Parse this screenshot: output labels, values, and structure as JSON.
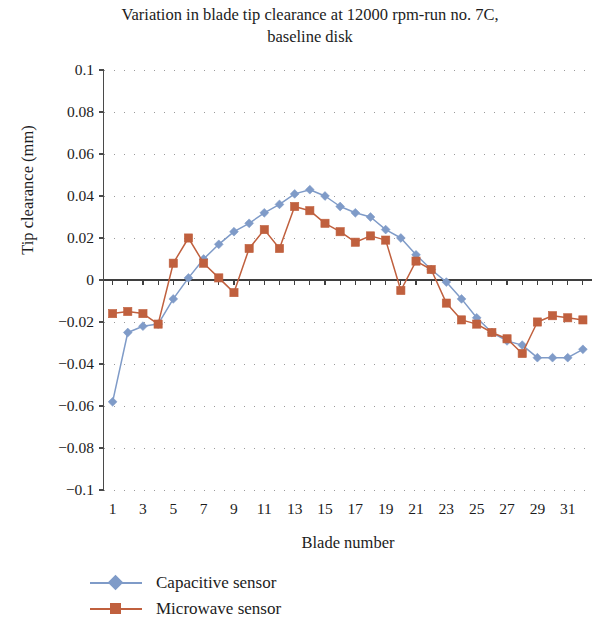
{
  "chart_data": {
    "type": "line",
    "title": "Variation in blade tip clearance at 12000 rpm-run no. 7C, baseline disk",
    "title_line1": "Variation in blade tip clearance at 12000 rpm-run no. 7C,",
    "title_line2": "baseline disk",
    "xlabel": "Blade number",
    "ylabel": "Tip clearance (mm)",
    "xlim": [
      0.4,
      32.6
    ],
    "ylim": [
      -0.1,
      0.1
    ],
    "grid": true,
    "grid_style": "dotted",
    "legend_position": "bottom-left",
    "y_ticks": [
      0.1,
      0.08,
      0.06,
      0.04,
      0.02,
      0,
      -0.02,
      -0.04,
      -0.06,
      -0.08,
      -0.1
    ],
    "y_tick_labels": [
      "0.1",
      "0.08",
      "0.06",
      "0.04",
      "0.02",
      "0",
      "−0.02",
      "−0.04",
      "−0.06",
      "−0.08",
      "−0.1"
    ],
    "x_ticks": [
      1,
      3,
      5,
      7,
      9,
      11,
      13,
      15,
      17,
      19,
      21,
      23,
      25,
      27,
      29,
      31
    ],
    "x_tick_labels": [
      "1",
      "3",
      "5",
      "7",
      "9",
      "11",
      "13",
      "15",
      "17",
      "19",
      "21",
      "23",
      "25",
      "27",
      "29",
      "31"
    ],
    "x": [
      1,
      2,
      3,
      4,
      5,
      6,
      7,
      8,
      9,
      10,
      11,
      12,
      13,
      14,
      15,
      16,
      17,
      18,
      19,
      20,
      21,
      22,
      23,
      24,
      25,
      26,
      27,
      28,
      29,
      30,
      31,
      32
    ],
    "series": [
      {
        "name": "Capacitive sensor",
        "color": "#7f9bc8",
        "marker": "diamond",
        "values": [
          -0.058,
          -0.025,
          -0.022,
          -0.021,
          -0.009,
          0.001,
          0.01,
          0.017,
          0.023,
          0.027,
          0.032,
          0.036,
          0.041,
          0.043,
          0.04,
          0.035,
          0.032,
          0.03,
          0.024,
          0.02,
          0.012,
          0.005,
          -0.001,
          -0.009,
          -0.018,
          -0.025,
          -0.029,
          -0.031,
          -0.037,
          -0.037,
          -0.037,
          -0.033
        ]
      },
      {
        "name": "Microwave sensor",
        "color": "#c0603e",
        "marker": "square",
        "values": [
          -0.016,
          -0.015,
          -0.016,
          -0.021,
          0.008,
          0.02,
          0.008,
          0.001,
          -0.006,
          0.015,
          0.024,
          0.015,
          0.035,
          0.033,
          0.027,
          0.023,
          0.018,
          0.021,
          0.019,
          -0.005,
          0.009,
          0.005,
          -0.011,
          -0.019,
          -0.021,
          -0.025,
          -0.028,
          -0.035,
          -0.02,
          -0.017,
          -0.018,
          -0.019
        ]
      }
    ]
  },
  "legend": {
    "items": [
      {
        "label": "Capacitive sensor",
        "color": "#7f9bc8",
        "marker": "diamond"
      },
      {
        "label": "Microwave sensor",
        "color": "#c0603e",
        "marker": "square"
      }
    ]
  },
  "axes": {
    "axis_color": "#4a4a4a",
    "grid_color": "#9a9a9a",
    "zero_line_color": "#3f3f3f"
  }
}
